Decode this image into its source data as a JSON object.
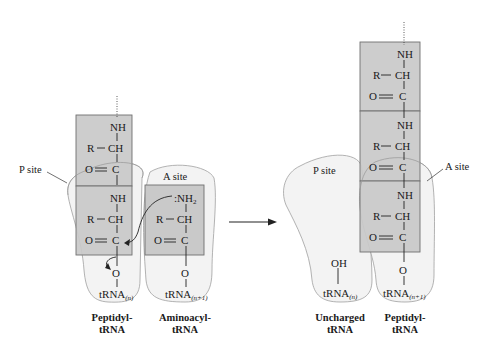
{
  "left_panel": {
    "p_site_label": "P site",
    "a_site_label": "A site",
    "peptidyl_chain": {
      "residue1": {
        "nh": "NH",
        "r": "R",
        "ch": "CH",
        "o": "O",
        "c": "C"
      },
      "residue2": {
        "nh": "NH",
        "r": "R",
        "ch": "CH",
        "o": "O",
        "c": "C"
      },
      "ester_o": "O",
      "trna": "tRNA",
      "trna_sub": "(n)"
    },
    "aminoacyl": {
      "nh2": ":NH",
      "nh2_sub": "2",
      "r": "R",
      "ch": "CH",
      "o": "O",
      "c": "C",
      "ester_o": "O",
      "trna": "tRNA",
      "trna_sub": "(n+1)"
    },
    "captions": {
      "peptidyl": [
        "Peptidyl-",
        "tRNA"
      ],
      "aminoacyl": [
        "Aminoacyl-",
        "tRNA"
      ]
    }
  },
  "reaction_arrow": "right-arrow",
  "right_panel": {
    "p_site_label": "P site",
    "a_site_label": "A  site",
    "peptidyl_chain": {
      "residue1": {
        "nh": "NH",
        "r": "R",
        "ch": "CH",
        "o": "O",
        "c": "C"
      },
      "residue2": {
        "nh": "NH",
        "r": "R",
        "ch": "CH",
        "o": "O",
        "c": "C"
      },
      "residue3": {
        "nh": "NH",
        "r": "R",
        "ch": "CH",
        "o": "O",
        "c": "C"
      },
      "ester_o": "O",
      "trna": "tRNA",
      "trna_sub": "(n+1)"
    },
    "uncharged": {
      "oh": "OH",
      "trna": "tRNA",
      "trna_sub": "(n)"
    },
    "captions": {
      "uncharged": [
        "Uncharged",
        "tRNA"
      ],
      "peptidyl": [
        "Peptidyl-",
        "tRNA"
      ]
    }
  },
  "colors": {
    "residue_box_fill": "#c9c9c9",
    "residue_box_stroke": "#6e6e6e",
    "site_fill": "#f2f2f2",
    "site_stroke": "#9a9a9a",
    "ink": "#1a1a1a"
  }
}
